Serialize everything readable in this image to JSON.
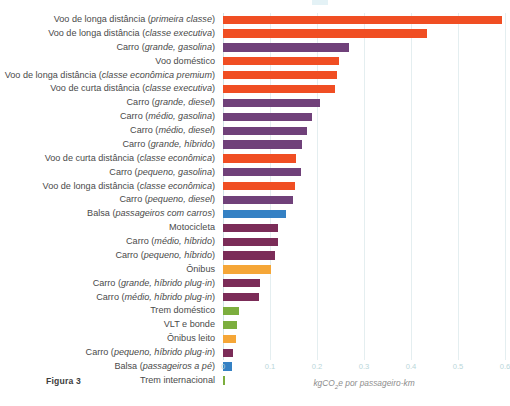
{
  "figure": {
    "caption": "Figura 3",
    "axis_title_main": "kgCO",
    "axis_title_sub": "2",
    "axis_title_rest": "e por passageiro-km"
  },
  "colors": {
    "orange_red": "#F04E23",
    "purple": "#70417A",
    "magenta_purple": "#7B2C58",
    "blue": "#3581C4",
    "amber": "#F5A637",
    "green": "#7CAE3E",
    "gridline": "#E4EEF0",
    "tick_text": "#B9D6D9",
    "label_text": "#4A4A4A"
  },
  "chart_data": {
    "type": "bar",
    "orientation": "horizontal",
    "title": "",
    "subtitle": "",
    "xlabel": "kgCO2e por passageiro-km",
    "ylabel": "",
    "xlim": [
      0,
      0.6
    ],
    "xticks": [
      "0",
      "0.1",
      "0.2",
      "0.3",
      "0.4",
      "0.5",
      "0.6"
    ],
    "xtick_values": [
      0,
      0.1,
      0.2,
      0.3,
      0.4,
      0.5,
      0.6
    ],
    "grid": true,
    "legend": "none",
    "categories": [
      "Voo de longa distância (primeira classe)",
      "Voo de longa distância (classe executiva)",
      "Carro (grande, gasolina)",
      "Voo doméstico",
      "Voo de longa distância (classe econômica premium)",
      "Voo de curta distância (classe executiva)",
      "Carro (grande, diesel)",
      "Carro (médio, gasolina)",
      "Carro (médio, diesel)",
      "Carro (grande, híbrido)",
      "Voo de curta distância (classe econômica)",
      "Carro (pequeno, gasolina)",
      "Voo de longa distância (classe econômica)",
      "Carro (pequeno, diesel)",
      "Balsa (passageiros com carros)",
      "Motocicleta",
      "Carro (médio, híbrido)",
      "Carro (pequeno, híbrido)",
      "Ônibus",
      "Carro (grande, híbrido plug-in)",
      "Carro (médio, híbrido plug-in)",
      "Trem doméstico",
      "VLT e bonde",
      "Ônibus leito",
      "Carro (pequeno, híbrido plug-in)",
      "Balsa (passageiros a pé)",
      "Trem internacional"
    ],
    "values": [
      0.594,
      0.434,
      0.268,
      0.246,
      0.243,
      0.238,
      0.207,
      0.189,
      0.178,
      0.168,
      0.155,
      0.167,
      0.153,
      0.148,
      0.133,
      0.117,
      0.116,
      0.111,
      0.103,
      0.079,
      0.077,
      0.035,
      0.029,
      0.028,
      0.022,
      0.019,
      0.005
    ],
    "bar_colors": [
      "#F04E23",
      "#F04E23",
      "#70417A",
      "#F04E23",
      "#F04E23",
      "#F04E23",
      "#70417A",
      "#70417A",
      "#70417A",
      "#70417A",
      "#F04E23",
      "#70417A",
      "#F04E23",
      "#70417A",
      "#3581C4",
      "#7B2C58",
      "#7B2C58",
      "#7B2C58",
      "#F5A637",
      "#7B2C58",
      "#7B2C58",
      "#7CAE3E",
      "#7CAE3E",
      "#F5A637",
      "#7B2C58",
      "#3581C4",
      "#7CAE3E"
    ],
    "labels_rich": [
      {
        "plain": "Voo de longa distância (",
        "italic": "primeira classe",
        "tail": ")"
      },
      {
        "plain": "Voo de longa distância (",
        "italic": "classe executiva",
        "tail": ")"
      },
      {
        "plain": "Carro (",
        "italic": "grande, gasolina",
        "tail": ")"
      },
      {
        "plain": "Voo doméstico",
        "italic": "",
        "tail": ""
      },
      {
        "plain": "Voo de longa distância (",
        "italic": "classe econômica premium",
        "tail": ")"
      },
      {
        "plain": "Voo de curta distância (",
        "italic": "classe executiva",
        "tail": ")"
      },
      {
        "plain": "Carro (",
        "italic": "grande, diesel",
        "tail": ")"
      },
      {
        "plain": "Carro (",
        "italic": "médio, gasolina",
        "tail": ")"
      },
      {
        "plain": "Carro (",
        "italic": "médio, diesel",
        "tail": ")"
      },
      {
        "plain": "Carro (",
        "italic": "grande, híbrido",
        "tail": ")"
      },
      {
        "plain": "Voo de curta distância (",
        "italic": "classe econômica",
        "tail": ")"
      },
      {
        "plain": "Carro (",
        "italic": "pequeno, gasolina",
        "tail": ")"
      },
      {
        "plain": "Voo de longa distância (",
        "italic": "classe econômica",
        "tail": ")"
      },
      {
        "plain": "Carro (",
        "italic": "pequeno, diesel",
        "tail": ")"
      },
      {
        "plain": "Balsa (",
        "italic": "passageiros com carros",
        "tail": ")"
      },
      {
        "plain": "Motocicleta",
        "italic": "",
        "tail": ""
      },
      {
        "plain": "Carro (",
        "italic": "médio, híbrido",
        "tail": ")"
      },
      {
        "plain": "Carro (",
        "italic": "pequeno, híbrido",
        "tail": ")"
      },
      {
        "plain": "Ônibus",
        "italic": "",
        "tail": ""
      },
      {
        "plain": "Carro (",
        "italic": "grande, híbrido plug-in",
        "tail": ")"
      },
      {
        "plain": "Carro (",
        "italic": "médio, híbrido plug-in",
        "tail": ")"
      },
      {
        "plain": "Trem doméstico",
        "italic": "",
        "tail": ""
      },
      {
        "plain": "VLT e bonde",
        "italic": "",
        "tail": ""
      },
      {
        "plain": "Ônibus leito",
        "italic": "",
        "tail": ""
      },
      {
        "plain": "Carro (",
        "italic": "pequeno, híbrido plug-in",
        "tail": ")"
      },
      {
        "plain": "Balsa (",
        "italic": "passageiros a pé",
        "tail": ")"
      },
      {
        "plain": "Trem internacional",
        "italic": "",
        "tail": ""
      }
    ]
  }
}
